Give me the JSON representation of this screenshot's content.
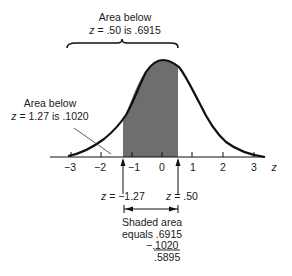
{
  "top_annotation": {
    "line1": "Area below",
    "var": "z",
    "line2_rest": " = .50 is .6915"
  },
  "left_annotation": {
    "line1": "Area below",
    "var": "z",
    "line2_rest": " = 1.27 is .1020"
  },
  "axis": {
    "variable": "z",
    "ticks": [
      "−3",
      "−2",
      "−1",
      "0",
      "1",
      "2",
      "3"
    ]
  },
  "markers": {
    "left": {
      "var": "z",
      "rest": " = −1.27"
    },
    "right": {
      "var": "z",
      "rest": " = .50"
    }
  },
  "calculation": {
    "line1": "Shaded area",
    "line2": "equals .6915",
    "line3": "−.1020",
    "line4": ".5895"
  },
  "colors": {
    "shade": "#6e6e6e",
    "curve": "#111111"
  }
}
